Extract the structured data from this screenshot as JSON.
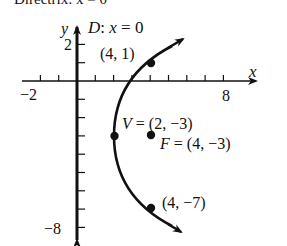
{
  "header_cut_text": "Directrix: x = 0",
  "graph": {
    "axis_x_label": "x",
    "axis_y_label": "y",
    "directrix_label": "D: x = 0",
    "tick_labels": {
      "x_neg": "−2",
      "x_pos": "8",
      "y_pos": "2",
      "y_neg": "−8"
    },
    "points": [
      {
        "name": "point-upper",
        "label": "(4, 1)",
        "x": 4,
        "y": 1
      },
      {
        "name": "vertex",
        "label": "V = (2, −3)",
        "x": 2,
        "y": -3
      },
      {
        "name": "focus",
        "label": "F = (4, −3)",
        "x": 4,
        "y": -3
      },
      {
        "name": "point-lower",
        "label": "(4, −7)",
        "x": 4,
        "y": -7
      }
    ],
    "equation": "(y + 3)^2 = 8(x − 2)"
  }
}
